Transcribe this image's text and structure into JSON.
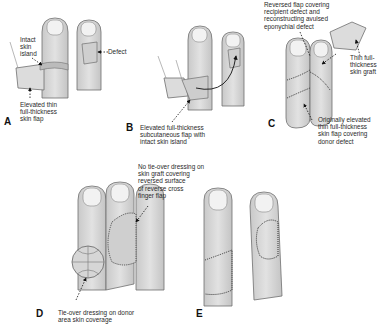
{
  "figure": {
    "panels": [
      {
        "id": "A",
        "label": "A",
        "annotations": [
          "Intact\nskin\nisland",
          "Defect",
          "Elevated thin\nfull-thickness\nskin flap"
        ]
      },
      {
        "id": "B",
        "label": "B",
        "annotations": [
          "Elevated full-thickness\nsubcutaneous flap with\nintact skin island"
        ]
      },
      {
        "id": "C",
        "label": "C",
        "annotations": [
          "Reversed flap covering\nrecipient defect and\nreconstructing avulsed\neponychial defect",
          "Thin full-\nthickness\nskin graft",
          "Originally elevated\nthin full-thickness\nskin flap covering\ndonor defect"
        ]
      },
      {
        "id": "D",
        "label": "D",
        "annotations": [
          "No tie-over dressing on\nskin graft covering\nreversed surface\nof reverse cross\nfinger flap",
          "Tie-over dressing on donor\narea skin coverage"
        ]
      },
      {
        "id": "E",
        "label": "E",
        "annotations": []
      }
    ]
  },
  "colors": {
    "skin": "#d9d9d9",
    "outline": "#6f6f6f",
    "nail": "#f2f2f2",
    "suture": "#333333"
  }
}
